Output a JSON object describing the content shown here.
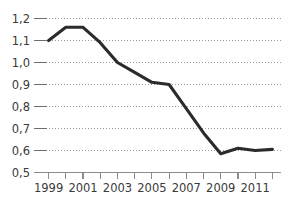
{
  "chart_data": {
    "type": "line",
    "title": "",
    "xlabel": "",
    "ylabel": "",
    "decimal_separator": ",",
    "grid": true,
    "grid_style": "dotted-horizontal",
    "legend": false,
    "legend_position": "none",
    "line_color": "#2b2b2b",
    "grid_color": "#9b9b9b",
    "axis_color": "#8c8c8c",
    "label_color": "#3a3a3a",
    "ylim": [
      0.5,
      1.2
    ],
    "xlim": [
      1998.5,
      2012.5
    ],
    "ytick_values": [
      1.2,
      1.1,
      1.0,
      0.9,
      0.8,
      0.7,
      0.6,
      0.5
    ],
    "ytick_labels": [
      "1,2",
      "1,1",
      "1,0",
      "0,9",
      "0,8",
      "0,7",
      "0,6",
      "0,5"
    ],
    "xtick_values": [
      1999,
      2000,
      2001,
      2002,
      2003,
      2004,
      2005,
      2006,
      2007,
      2008,
      2009,
      2010,
      2011,
      2012
    ],
    "xtick_labels": [
      "1999",
      "",
      "2001",
      "",
      "2003",
      "",
      "2005",
      "",
      "2007",
      "",
      "2009",
      "",
      "2011",
      ""
    ],
    "x": [
      1999,
      2000,
      2001,
      2002,
      2003,
      2004,
      2005,
      2006,
      2007,
      2008,
      2009,
      2010,
      2011,
      2012
    ],
    "values": [
      1.1,
      1.16,
      1.16,
      1.09,
      1.0,
      0.955,
      0.91,
      0.9,
      0.79,
      0.68,
      0.585,
      0.61,
      0.6,
      0.605
    ],
    "series": [
      {
        "name": "",
        "values": [
          1.1,
          1.16,
          1.16,
          1.09,
          1.0,
          0.955,
          0.91,
          0.9,
          0.79,
          0.68,
          0.585,
          0.61,
          0.6,
          0.605
        ]
      }
    ]
  }
}
